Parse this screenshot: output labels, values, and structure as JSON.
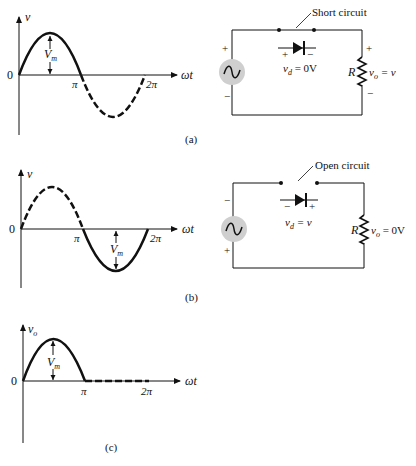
{
  "panels": [
    {
      "label": "(a)",
      "graph": {
        "y_axis_label": "v",
        "x_axis_label": "ωt",
        "origin_label": "0",
        "tick_pi": "π",
        "tick_2pi": "2π",
        "amplitude_label": "V",
        "amplitude_sub": "m"
      },
      "circuit": {
        "annotation": "Short circuit",
        "diode_plus": "+",
        "diode_minus": "−",
        "vd_label": "v",
        "vd_sub": "d",
        "vd_value": " = 0V",
        "source_top_sign": "+",
        "source_bottom_sign": "−",
        "resistor_label": "R",
        "vo_label": "v",
        "vo_sub": "o",
        "vo_value": " = v",
        "load_top_sign": "+",
        "load_bottom_sign": "−"
      }
    },
    {
      "label": "(b)",
      "graph": {
        "y_axis_label": "v",
        "x_axis_label": "ωt",
        "origin_label": "0",
        "tick_pi": "π",
        "tick_2pi": "2π",
        "amplitude_label": "V",
        "amplitude_sub": "m"
      },
      "circuit": {
        "annotation": "Open circuit",
        "diode_plus": "+",
        "diode_minus": "−",
        "vd_label": "v",
        "vd_sub": "d",
        "vd_value": " = v",
        "source_top_sign": "−",
        "source_bottom_sign": "+",
        "resistor_label": "R",
        "vo_label": "v",
        "vo_sub": "o",
        "vo_value": " = 0V"
      }
    },
    {
      "label": "(c)",
      "graph": {
        "y_axis_label": "v",
        "y_axis_sub": "o",
        "x_axis_label": "ωt",
        "origin_label": "0",
        "tick_pi": "π",
        "tick_2pi": "2π",
        "amplitude_label": "V",
        "amplitude_sub": "m"
      }
    }
  ]
}
